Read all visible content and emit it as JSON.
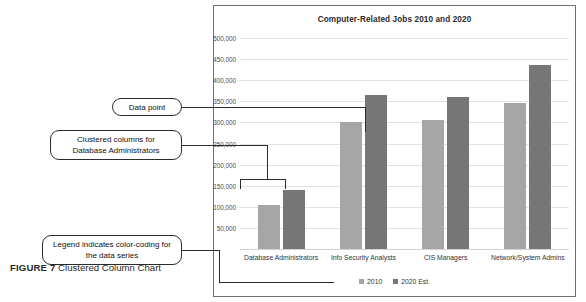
{
  "chart_data": {
    "type": "bar",
    "title": "Computer-Related Jobs 2010 and 2020",
    "xlabel": "",
    "ylabel": "",
    "ylim": [
      0,
      500000
    ],
    "ytick_step": 50000,
    "grid": true,
    "legend_position": "bottom",
    "categories": [
      "Database Administrators",
      "Info Security Analysts",
      "CIS Managers",
      "Network/System Admins"
    ],
    "ytick_labels": [
      "500,000",
      "450,000",
      "400,000",
      "350,000",
      "300,000",
      "250,000",
      "200,000",
      "150,000",
      "100,000",
      "50,000"
    ],
    "series": [
      {
        "name": "2010",
        "color": "#a6a6a6",
        "values": [
          105000,
          300000,
          305000,
          345000
        ]
      },
      {
        "name": "2020 Est.",
        "color": "#767676",
        "values": [
          140000,
          365000,
          360000,
          435000
        ]
      }
    ]
  },
  "callouts": {
    "data_point": "Data point",
    "clustered_columns": "Clustered columns for Database Administrators",
    "legend": "Legend indicates color-coding for the data series"
  },
  "caption": {
    "figure_label": "FIGURE 7",
    "text": " Clustered Column Chart"
  }
}
